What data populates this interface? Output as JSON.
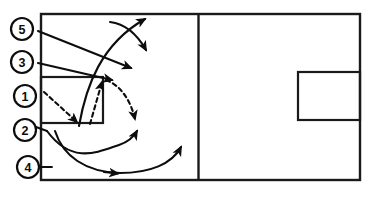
{
  "diagram": {
    "court": {
      "outline_name": "full-court-outline",
      "center_line_name": "center-line",
      "left_key_name": "left-key-rectangle",
      "right_key_name": "right-key-rectangle",
      "line_color": "#1a1a1a",
      "background_color": "#ffffff"
    },
    "players": [
      {
        "id": "p5",
        "label": "5",
        "cx": 22,
        "cy": 29,
        "r": 11
      },
      {
        "id": "p3",
        "label": "3",
        "cx": 22,
        "cy": 62,
        "r": 11
      },
      {
        "id": "p1",
        "label": "1",
        "cx": 25,
        "cy": 96,
        "r": 11
      },
      {
        "id": "p2",
        "label": "2",
        "cx": 25,
        "cy": 130,
        "r": 11
      },
      {
        "id": "p4",
        "label": "4",
        "cx": 28,
        "cy": 167,
        "r": 11
      }
    ],
    "routes": [
      {
        "id": "r5",
        "player": "5",
        "style": "solid",
        "description": "straight cut from 5 toward mid-court"
      },
      {
        "id": "r3",
        "player": "3",
        "style": "solid",
        "description": "straight cut from 3 toward the key"
      },
      {
        "id": "r1",
        "player": "1",
        "style": "dashed",
        "description": "pass from 1 into the low key"
      },
      {
        "id": "r1b",
        "player": "1",
        "style": "dashed",
        "description": "pass arc from key corner out to the wing"
      },
      {
        "id": "r2",
        "player": "2",
        "style": "solid",
        "description": "curl from 2 up out to the wing"
      },
      {
        "id": "r4",
        "player": "4",
        "style": "solid",
        "description": "baseline sweep from 4 across to the far side"
      },
      {
        "id": "rbig",
        "player": "5",
        "style": "solid",
        "description": "long arc up from the low post to the top"
      }
    ],
    "legend": {
      "solid_meaning": "player movement",
      "dashed_meaning": "pass"
    }
  }
}
